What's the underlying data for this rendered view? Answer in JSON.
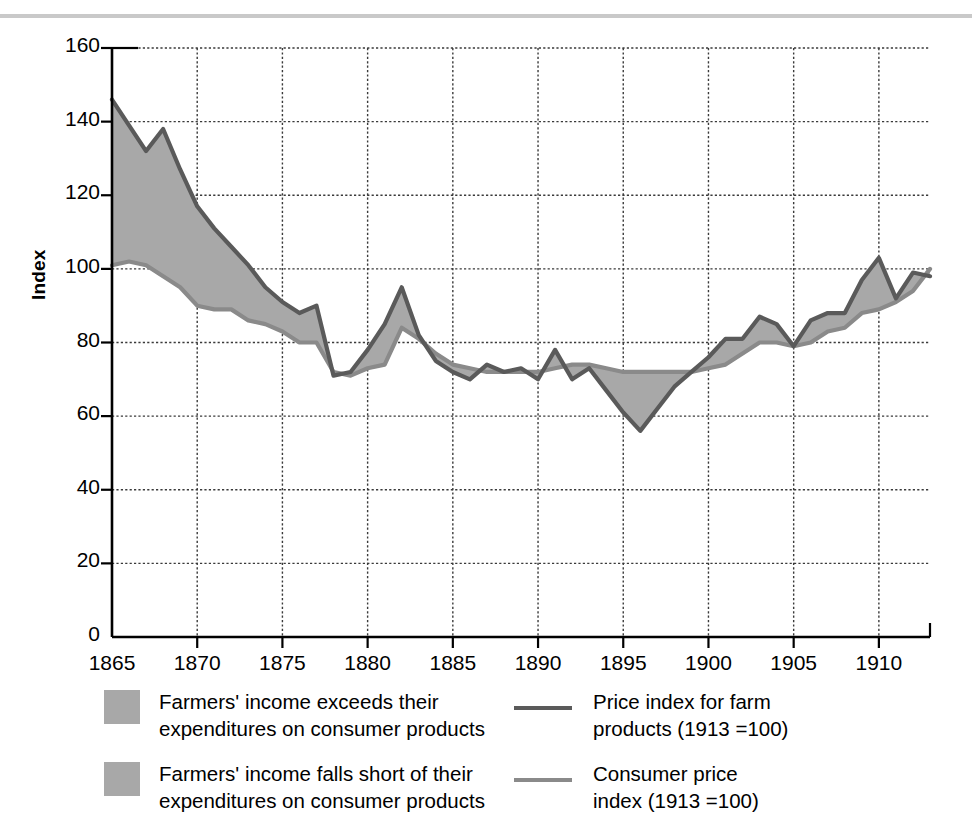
{
  "margin_note": {
    "line1": "s",
    "line2": "f"
  },
  "axes": {
    "ylabel": "Index",
    "yticks": [
      0,
      20,
      40,
      60,
      80,
      100,
      120,
      140,
      160
    ],
    "xticks": [
      1865,
      1870,
      1875,
      1880,
      1885,
      1890,
      1895,
      1905,
      1910
    ],
    "xtick_labels": [
      "1865",
      "1870",
      "1875",
      "1880",
      "1885",
      "1890",
      "1895",
      "1900",
      "1905",
      "1910"
    ],
    "ylim": [
      0,
      160
    ],
    "xlim": [
      1865,
      1913
    ]
  },
  "legend": {
    "items": [
      {
        "swatch": "area-fill",
        "label": "Farmers' income exceeds their\nexpenditures on consumer products"
      },
      {
        "swatch": "area-fill",
        "label": "Farmers' income falls short of their\nexpenditures on consumer products"
      },
      {
        "swatch": "line-dark",
        "label": "Price index for farm\nproducts (1913 =100)"
      },
      {
        "swatch": "line-mid",
        "label": "Consumer price\nindex (1913 =100)"
      }
    ]
  },
  "colors": {
    "area_fill": "#a8a8a8",
    "farm_line": "#5a5a5a",
    "cpi_line": "#8a8a8a",
    "grid": "#3a3a3a",
    "axis": "#000000",
    "top_rule": "#c9c9c9"
  },
  "chart_data": {
    "type": "line",
    "title": "",
    "xlabel": "",
    "ylabel": "Index",
    "xlim": [
      1865,
      1913
    ],
    "ylim": [
      0,
      160
    ],
    "grid": true,
    "legend_position": "below",
    "x": [
      1865,
      1866,
      1867,
      1868,
      1869,
      1870,
      1871,
      1872,
      1873,
      1874,
      1875,
      1876,
      1877,
      1878,
      1879,
      1880,
      1881,
      1882,
      1883,
      1884,
      1885,
      1886,
      1887,
      1888,
      1889,
      1890,
      1891,
      1892,
      1893,
      1894,
      1895,
      1896,
      1897,
      1898,
      1899,
      1900,
      1901,
      1902,
      1903,
      1904,
      1905,
      1906,
      1907,
      1908,
      1909,
      1910,
      1911,
      1912,
      1913
    ],
    "series": [
      {
        "name": "Price index for farm products (1913 =100)",
        "values": [
          146,
          139,
          132,
          138,
          127,
          117,
          111,
          106,
          101,
          95,
          91,
          88,
          90,
          71,
          72,
          78,
          85,
          95,
          82,
          75,
          72,
          70,
          74,
          72,
          73,
          70,
          78,
          70,
          73,
          67,
          61,
          56,
          62,
          68,
          72,
          76,
          81,
          81,
          87,
          85,
          79,
          86,
          88,
          88,
          97,
          103,
          92,
          99,
          98
        ]
      },
      {
        "name": "Consumer price index (1913 =100)",
        "values": [
          101,
          102,
          101,
          98,
          95,
          90,
          89,
          89,
          86,
          85,
          83,
          80,
          80,
          72,
          71,
          73,
          74,
          84,
          81,
          77,
          74,
          73,
          72,
          72,
          72,
          72,
          73,
          74,
          74,
          73,
          72,
          72,
          72,
          72,
          72,
          73,
          74,
          77,
          80,
          80,
          79,
          80,
          83,
          84,
          88,
          89,
          91,
          94,
          100
        ]
      }
    ]
  }
}
